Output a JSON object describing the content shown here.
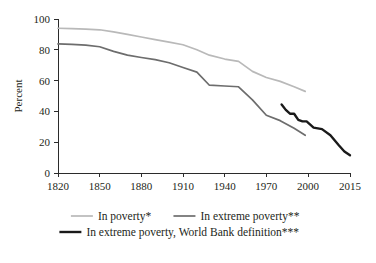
{
  "chart_data": {
    "type": "line",
    "title": "",
    "subtitle": "",
    "xlabel": "",
    "ylabel": "Percent",
    "xlim": [
      1820,
      2015
    ],
    "ylim": [
      0,
      100
    ],
    "grid": false,
    "legend_position": "bottom",
    "x_ticks": [
      "1820",
      "1850",
      "1880",
      "1910",
      "1940",
      "1970",
      "2000",
      "2015"
    ],
    "x_tick_values": [
      1820,
      1850,
      1880,
      1910,
      1940,
      1970,
      2000,
      2015
    ],
    "y_ticks": [
      "0",
      "20",
      "40",
      "60",
      "80",
      "100"
    ],
    "y_tick_values": [
      0,
      20,
      40,
      60,
      80,
      100
    ],
    "series": [
      {
        "name": "In poverty*",
        "color": "#b9b9b9",
        "width": 1.7,
        "x": [
          1820,
          1830,
          1840,
          1850,
          1860,
          1870,
          1880,
          1890,
          1900,
          1910,
          1920,
          1929,
          1940,
          1950,
          1960,
          1970,
          1980,
          1990,
          1998
        ],
        "values": [
          94.0,
          93.7,
          93.4,
          93.0,
          91.6,
          90.0,
          88.3,
          86.6,
          85.0,
          83.3,
          80.0,
          76.5,
          74.0,
          72.5,
          66.0,
          62.0,
          59.5,
          56.0,
          53.0
        ]
      },
      {
        "name": "In extreme poverty**",
        "color": "#6d6d6d",
        "width": 1.7,
        "x": [
          1820,
          1830,
          1840,
          1850,
          1860,
          1870,
          1880,
          1890,
          1900,
          1910,
          1920,
          1929,
          1940,
          1950,
          1960,
          1970,
          1980,
          1990,
          1998
        ],
        "values": [
          83.8,
          83.5,
          83.0,
          82.0,
          79.0,
          76.5,
          75.0,
          73.6,
          71.6,
          68.5,
          65.5,
          57.0,
          56.5,
          56.0,
          47.5,
          37.5,
          34.0,
          29.0,
          24.5
        ]
      },
      {
        "name": "In extreme poverty, World Bank definition***",
        "color": "#1a1a1a",
        "width": 2.4,
        "x": [
          1981,
          1984,
          1987,
          1990,
          1993,
          1996,
          1999,
          2002,
          2005,
          2008,
          2011,
          2013,
          2015
        ],
        "values": [
          44.5,
          41.0,
          38.5,
          38.5,
          34.5,
          33.5,
          33.5,
          29.5,
          28.5,
          24.5,
          18.0,
          14.0,
          11.5
        ]
      }
    ],
    "legend": [
      {
        "label": "In poverty*",
        "color": "#b9b9b9",
        "width": 1.7
      },
      {
        "label": "In extreme poverty**",
        "color": "#6d6d6d",
        "width": 1.7
      },
      {
        "label": "In extreme poverty, World Bank definition***",
        "color": "#1a1a1a",
        "width": 2.4
      }
    ]
  }
}
